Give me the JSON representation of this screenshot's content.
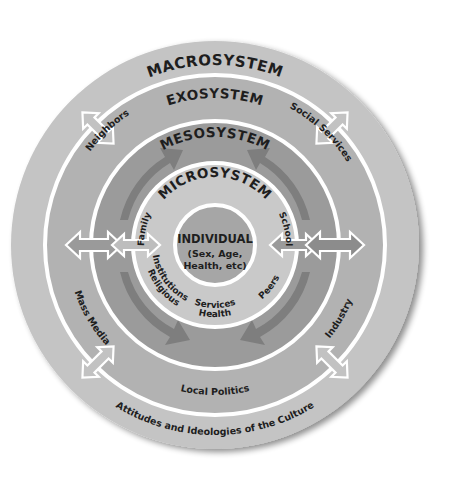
{
  "colors": {
    "background": "#ffffff",
    "macrosystem": "#c4c4c4",
    "exosystem": "#b2b2b2",
    "mesosystem": "#9b9b9b",
    "microsystem": "#c9c9c9",
    "individual": "#a6a6a6",
    "ring_line": "#ffffff",
    "meso_arrows": "#7e7e7e",
    "light_arrows": "#bdbdbd",
    "text": "#1e1e1e"
  },
  "diagram": {
    "type": "concentric-circles",
    "rings": [
      {
        "id": "macrosystem",
        "title": "MACROSYSTEM",
        "items": [
          "Attitudes and Ideologies of the Culture"
        ]
      },
      {
        "id": "exosystem",
        "title": "EXOSYSTEM",
        "items": [
          "Neighbors",
          "Social Services",
          "Mass Media",
          "Industry",
          "Local Politics"
        ]
      },
      {
        "id": "mesosystem",
        "title": "MESOSYSTEM",
        "items": []
      },
      {
        "id": "microsystem",
        "title": "MICROSYSTEM",
        "items": [
          "Family",
          "School",
          "Religious Institutions",
          "Health Services",
          "Peers"
        ]
      }
    ],
    "center": {
      "title": "INDIVIDUAL",
      "subtitle_line1": "(Sex, Age,",
      "subtitle_line2": "Health, etc)"
    }
  },
  "labels": {
    "macrosystem": "MACROSYSTEM",
    "exosystem": "EXOSYSTEM",
    "mesosystem": "MESOSYSTEM",
    "microsystem": "MICROSYSTEM",
    "culture": "Attitudes and Ideologies of the Culture",
    "neighbors": "Neighbors",
    "social_services": "Social Services",
    "mass_media": "Mass Media",
    "industry": "Industry",
    "local_politics": "Local Politics",
    "family": "Family",
    "school": "School",
    "religious_1": "Religious",
    "religious_2": "Institutions",
    "health_1": "Health",
    "health_2": "Services",
    "peers": "Peers",
    "individual": "INDIVIDUAL",
    "individual_sub1": "(Sex, Age,",
    "individual_sub2": "Health, etc)"
  }
}
